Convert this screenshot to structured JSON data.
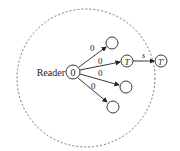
{
  "diagram": {
    "reader_label": "Reader",
    "source_node": {
      "label": "0"
    },
    "edge_labels": [
      "0",
      "0",
      "0",
      "0"
    ],
    "nodes": {
      "top": "",
      "T": "T",
      "lower": "",
      "bottom": ""
    },
    "external_node": {
      "label": "T'"
    },
    "external_edge_label": "s",
    "colors": {
      "stroke": "#222222",
      "dashed_circle": "#555555",
      "background": "#ffffff"
    }
  }
}
